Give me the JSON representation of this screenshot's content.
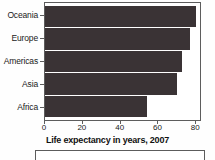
{
  "chart_data": {
    "type": "bar",
    "orientation": "horizontal",
    "title": "",
    "xlabel": "Life expectancy in years, 2007",
    "ylabel": "",
    "categories": [
      "Oceania",
      "Europe",
      "Americas",
      "Asia",
      "Africa"
    ],
    "values": [
      80.7,
      77.6,
      73.6,
      70.7,
      54.8
    ],
    "xlim": [
      0,
      83
    ],
    "xticks": [
      0,
      20,
      40,
      60,
      80
    ],
    "xticklabels": [
      "0",
      "20",
      "40",
      "60",
      "80"
    ],
    "grid": false,
    "legend": null,
    "bar_color": "#3a3335",
    "axis_color": "#5c5c5c",
    "text_color": "#1a1a1a"
  },
  "figure": {
    "xaxis_title": "Life expectancy in years, 2007",
    "second_panel_present": true
  }
}
